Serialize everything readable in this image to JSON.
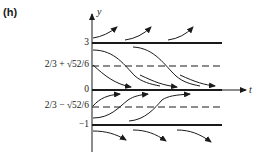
{
  "figure": {
    "panel_label": "(h)",
    "axes": {
      "x_label": "t",
      "y_label": "y"
    },
    "y_levels": [
      {
        "label": "3",
        "type": "equilibrium",
        "style": "solid"
      },
      {
        "label": "2/3 + √52/6",
        "type": "inflection",
        "style": "dashed"
      },
      {
        "label": "0",
        "type": "equilibrium",
        "style": "solid"
      },
      {
        "label": "2/3 − √52/6",
        "type": "inflection",
        "style": "dashed"
      },
      {
        "label": "−1",
        "type": "equilibrium",
        "style": "solid"
      }
    ],
    "colors": {
      "ink": "#1a1a1a",
      "background": "#ffffff"
    }
  }
}
